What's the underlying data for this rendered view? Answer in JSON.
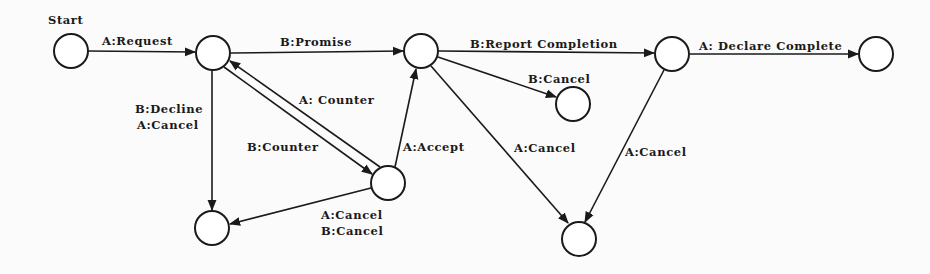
{
  "diagram": {
    "type": "state-transition",
    "ink_color": "#1a1a1a",
    "background_color": "#fbfbfb",
    "start_label": "Start",
    "nodes": [
      {
        "id": "start",
        "cx": 71,
        "cy": 51,
        "r": 17
      },
      {
        "id": "requested",
        "cx": 213,
        "cy": 53,
        "r": 17
      },
      {
        "id": "promised",
        "cx": 421,
        "cy": 51,
        "r": 17
      },
      {
        "id": "reported",
        "cx": 672,
        "cy": 54,
        "r": 17
      },
      {
        "id": "complete",
        "cx": 876,
        "cy": 54,
        "r": 17
      },
      {
        "id": "b-cancelled",
        "cx": 573,
        "cy": 104,
        "r": 17
      },
      {
        "id": "countered",
        "cx": 388,
        "cy": 183,
        "r": 17
      },
      {
        "id": "declined",
        "cx": 212,
        "cy": 228,
        "r": 17
      },
      {
        "id": "a-cancelled",
        "cx": 579,
        "cy": 239,
        "r": 17
      }
    ],
    "edges": [
      {
        "from": "start",
        "to": "requested",
        "label": "A:Request"
      },
      {
        "from": "requested",
        "to": "promised",
        "label": "B:Promise"
      },
      {
        "from": "promised",
        "to": "reported",
        "label": "B:Report Completion"
      },
      {
        "from": "reported",
        "to": "complete",
        "label": "A: Declare Complete"
      },
      {
        "from": "promised",
        "to": "b-cancelled",
        "label": "B:Cancel"
      },
      {
        "from": "countered",
        "to": "requested",
        "label": "A: Counter"
      },
      {
        "from": "requested",
        "to": "countered",
        "label": "B:Counter"
      },
      {
        "from": "countered",
        "to": "promised",
        "label": "A:Accept"
      },
      {
        "from": "requested",
        "to": "declined",
        "label_lines": [
          "B:Decline",
          "A:Cancel"
        ]
      },
      {
        "from": "countered",
        "to": "declined",
        "label_lines": [
          "A:Cancel",
          "B:Cancel"
        ]
      },
      {
        "from": "promised",
        "to": "a-cancelled",
        "label": "A:Cancel"
      },
      {
        "from": "reported",
        "to": "a-cancelled",
        "label": "A:Cancel"
      }
    ]
  },
  "labels": {
    "start": "Start",
    "request": "A:Request",
    "promise": "B:Promise",
    "report_completion": "B:Report Completion",
    "declare_complete": "A: Declare Complete",
    "b_cancel_top": "B:Cancel",
    "a_counter": "A: Counter",
    "b_counter": "B:Counter",
    "a_accept": "A:Accept",
    "decline_line1": "B:Decline",
    "decline_line2": "A:Cancel",
    "counter_cancel_line1": "A:Cancel",
    "counter_cancel_line2": "B:Cancel",
    "a_cancel_mid": "A:Cancel",
    "a_cancel_right": "A:Cancel"
  }
}
